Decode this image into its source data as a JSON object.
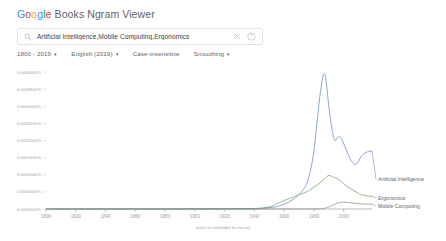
{
  "header": {
    "title_google": "Google",
    "title_rest": " Books Ngram Viewer"
  },
  "search": {
    "query": "Artificial Intelligence,Mobile Computing,Ergonomics",
    "placeholder": "Search in Google Books Ngram Viewer",
    "search_icon": "search-icon",
    "clear_icon": "close-icon",
    "help_icon": "help-circle-icon"
  },
  "options": {
    "date_range": "1800 - 2019",
    "corpus": "English (2019)",
    "case_sensitivity": "Case-insensitive",
    "smoothing": "Smoothing",
    "caret": "▾"
  },
  "chart_data": {
    "type": "line",
    "title": "",
    "xlabel": "",
    "ylabel": "",
    "note": "(click on line/label for focus)",
    "grid": false,
    "legend_position": "right-inline",
    "xlim": [
      1800,
      2019
    ],
    "ylim": [
      0,
      0.0004
    ],
    "xticks": [
      1800,
      1820,
      1840,
      1860,
      1880,
      1900,
      1920,
      1940,
      1960,
      1980,
      2000
    ],
    "yticks": [
      0.0,
      5e-05,
      0.0001,
      0.00015,
      0.0002,
      0.00025,
      0.0003,
      0.00035,
      0.0004
    ],
    "ytick_labels": [
      "0.0000000%",
      "0.0000500%",
      "0.0001000%",
      "0.0001500%",
      "0.0002000%",
      "0.0002500%",
      "0.0003000%",
      "0.0003500%",
      "0.0004000%"
    ],
    "series": [
      {
        "name": "Artificial Intelligence",
        "color": "#5a7fc4",
        "label_y_pct": 8.65e-05,
        "x": [
          1800,
          1820,
          1840,
          1860,
          1880,
          1900,
          1920,
          1930,
          1940,
          1950,
          1955,
          1960,
          1963,
          1966,
          1969,
          1972,
          1975,
          1978,
          1980,
          1982,
          1984,
          1986,
          1987,
          1988,
          1990,
          1992,
          1994,
          1996,
          1998,
          2000,
          2002,
          2004,
          2006,
          2008,
          2010,
          2012,
          2015,
          2019
        ],
        "values": [
          0.0,
          0.0,
          0.0,
          0.0,
          2e-07,
          4e-07,
          8e-07,
          1.2e-06,
          1.6e-06,
          4e-06,
          7e-06,
          1.4e-05,
          2e-05,
          2.8e-05,
          3.8e-05,
          5.2e-05,
          7.2e-05,
          0.00012,
          0.00017,
          0.00025,
          0.00033,
          0.000385,
          0.000395,
          0.00038,
          0.0003,
          0.000235,
          0.0002,
          0.00021,
          0.000208,
          0.00019,
          0.00017,
          0.00015,
          0.000135,
          0.00013,
          0.00014,
          0.000155,
          0.000165,
          0.00017
        ]
      },
      {
        "name": "Ergonomics",
        "color": "#6b9a5f",
        "label_y_pct": 3.2e-05,
        "x": [
          1800,
          1850,
          1900,
          1920,
          1940,
          1950,
          1955,
          1960,
          1965,
          1970,
          1975,
          1980,
          1984,
          1987,
          1990,
          1993,
          1996,
          1998,
          2000,
          2003,
          2006,
          2009,
          2012,
          2015,
          2019
        ],
        "values": [
          0.0,
          0.0,
          0.0,
          0.0,
          2e-07,
          6e-06,
          1.5e-05,
          2.5e-05,
          3.3e-05,
          4.2e-05,
          5e-05,
          6.4e-05,
          7.6e-05,
          8.8e-05,
          9.8e-05,
          9.3e-05,
          8.8e-05,
          8.2e-05,
          7.4e-05,
          6.4e-05,
          5.6e-05,
          4.8e-05,
          4.2e-05,
          3.9e-05,
          3.7e-05
        ]
      },
      {
        "name": "Mobile Computing",
        "color": "#8a8a8a",
        "label_y_pct": 8.5e-06,
        "x": [
          1800,
          1900,
          1940,
          1960,
          1970,
          1980,
          1985,
          1988,
          1990,
          1992,
          1994,
          1996,
          1998,
          2000,
          2003,
          2006,
          2009,
          2012,
          2015,
          2019
        ],
        "values": [
          0.0,
          0.0,
          0.0,
          0.0,
          0.0,
          2e-07,
          1e-06,
          3e-06,
          6e-06,
          1e-05,
          1.4e-05,
          1.75e-05,
          1.95e-05,
          2e-05,
          1.9e-05,
          1.75e-05,
          1.6e-05,
          1.5e-05,
          1.45e-05,
          1.4e-05
        ]
      }
    ]
  }
}
